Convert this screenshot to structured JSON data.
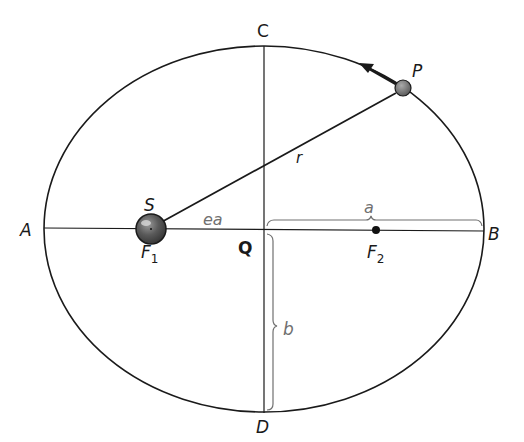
{
  "diagram": {
    "colors": {
      "line": "#1a1a1a",
      "bracket": "#707070",
      "planet_fill": "#6e6e6e",
      "sun_fill": "#5a5a5a",
      "background": "#ffffff"
    },
    "points": {
      "A": "A",
      "B": "B",
      "C": "C",
      "D": "D",
      "Q": "Q",
      "P": "P",
      "S": "S",
      "F1_main": "F",
      "F1_sub": "1",
      "F2_main": "F",
      "F2_sub": "2"
    },
    "segments": {
      "r": "r",
      "ea": "ea",
      "a": "a",
      "b": "b"
    },
    "geometry": {
      "center": [
        265,
        229
      ],
      "rx": 220,
      "ry": 183,
      "focus1": [
        151,
        229
      ],
      "focus2": [
        376,
        231
      ],
      "planet": [
        403,
        88
      ]
    }
  }
}
